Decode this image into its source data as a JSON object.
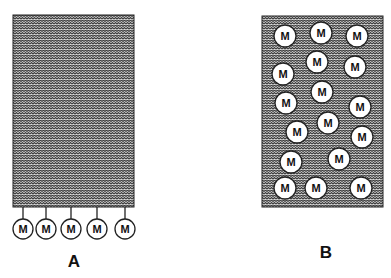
{
  "panels": [
    {
      "id": "A",
      "label": "A",
      "label_pos": [
        74,
        262
      ],
      "box": {
        "x": 13,
        "y": 15,
        "w": 121,
        "h": 192
      },
      "membrane_particles": [
        {
          "text": "M",
          "cx": 23,
          "cy": 229
        },
        {
          "text": "M",
          "cx": 46,
          "cy": 229
        },
        {
          "text": "M",
          "cx": 71,
          "cy": 229
        },
        {
          "text": "M",
          "cx": 97,
          "cy": 229
        },
        {
          "text": "M",
          "cx": 125,
          "cy": 229
        }
      ]
    },
    {
      "id": "B",
      "label": "B",
      "label_pos": [
        326,
        253
      ],
      "box": {
        "x": 262,
        "y": 16,
        "w": 121,
        "h": 191
      },
      "dispersed_particles": [
        {
          "text": "M",
          "cx": 285,
          "cy": 36
        },
        {
          "text": "M",
          "cx": 321,
          "cy": 33
        },
        {
          "text": "M",
          "cx": 357,
          "cy": 36
        },
        {
          "text": "M",
          "cx": 283,
          "cy": 74
        },
        {
          "text": "M",
          "cx": 317,
          "cy": 62
        },
        {
          "text": "M",
          "cx": 355,
          "cy": 67
        },
        {
          "text": "M",
          "cx": 286,
          "cy": 103
        },
        {
          "text": "M",
          "cx": 322,
          "cy": 92
        },
        {
          "text": "M",
          "cx": 360,
          "cy": 107
        },
        {
          "text": "M",
          "cx": 297,
          "cy": 132
        },
        {
          "text": "M",
          "cx": 328,
          "cy": 123
        },
        {
          "text": "M",
          "cx": 362,
          "cy": 137
        },
        {
          "text": "M",
          "cx": 291,
          "cy": 162
        },
        {
          "text": "M",
          "cx": 339,
          "cy": 159
        },
        {
          "text": "M",
          "cx": 285,
          "cy": 188
        },
        {
          "text": "M",
          "cx": 316,
          "cy": 188
        },
        {
          "text": "M",
          "cx": 361,
          "cy": 188
        }
      ]
    }
  ],
  "colors": {
    "fill_dark": "#555555",
    "fill_light": "#e6e6e6",
    "stroke": "#222222",
    "circle_fill": "#ffffff"
  }
}
